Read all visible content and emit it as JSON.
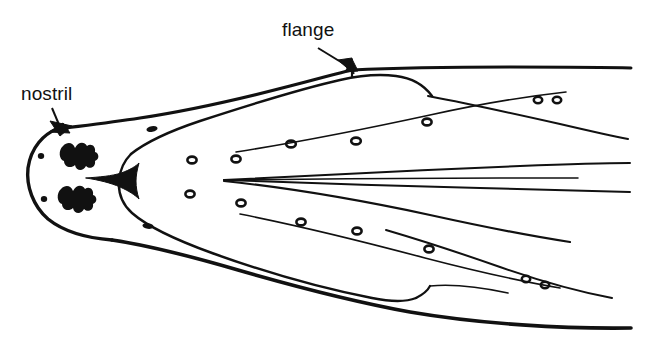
{
  "figure": {
    "type": "line-drawing",
    "width": 648,
    "height": 346,
    "background_color": "#ffffff",
    "ink_color": "#111111"
  },
  "annotations": {
    "nostril": {
      "label": "nostril",
      "leader_from": [
        52,
        108
      ],
      "leader_to": [
        60,
        129
      ],
      "arrowhead_at": [
        60,
        129
      ]
    },
    "flange": {
      "label": "flange",
      "leader_from": [
        318,
        48
      ],
      "leader_to": [
        352,
        71
      ],
      "arrowhead_at": [
        352,
        71
      ]
    }
  },
  "features": {
    "nostril_blobs": 2,
    "pore_rings": 14,
    "filled_specks": 6,
    "central_wedge": "dark triangular notch at snout midline",
    "outline_lines": 2,
    "internal_contours": 8
  }
}
